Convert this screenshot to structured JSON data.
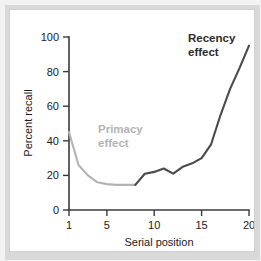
{
  "figure": {
    "background_color": "#f2f2f2",
    "card_color": "#ffffff",
    "border_color": "#cfcfcf"
  },
  "annotations": {
    "primacy": {
      "line1": "Primacy",
      "line2": "effect",
      "color": "#b3b3b3"
    },
    "recency": {
      "line1": "Recency",
      "line2": "effect",
      "color": "#2b2b2b"
    }
  },
  "chart_data": {
    "type": "line",
    "title": "",
    "xlabel": "Serial position",
    "ylabel": "Percent recall",
    "xlim": [
      1,
      20
    ],
    "ylim": [
      0,
      100
    ],
    "xticks": [
      1,
      5,
      10,
      15,
      20
    ],
    "xtick_labels": [
      "1",
      "5",
      "10",
      "15",
      "20"
    ],
    "yticks": [
      0,
      20,
      40,
      60,
      80,
      100
    ],
    "ytick_labels": [
      "0",
      "20",
      "40",
      "60",
      "80",
      "100"
    ],
    "grid": false,
    "legend": "none",
    "x": [
      1,
      2,
      3,
      4,
      5,
      6,
      7,
      8,
      9,
      10,
      11,
      12,
      13,
      14,
      15,
      16,
      17,
      18,
      19,
      20
    ],
    "series": [
      {
        "name": "Percent recall",
        "values": [
          45,
          26,
          20,
          16,
          15,
          14.5,
          14.5,
          14.5,
          21,
          22,
          24,
          21,
          25,
          27,
          30,
          38,
          55,
          70,
          82,
          95
        ],
        "segment_colors": {
          "primacy_color": "#b3b3b3",
          "recency_color": "#4a4a4a",
          "split_position": 8
        }
      }
    ],
    "annotation_labels": [
      {
        "text": "Primacy effect",
        "x": 4.2,
        "y": 47,
        "color": "#b3b3b3"
      },
      {
        "text": "Recency effect",
        "x": 16.2,
        "y": 90,
        "color": "#2b2b2b"
      }
    ]
  }
}
